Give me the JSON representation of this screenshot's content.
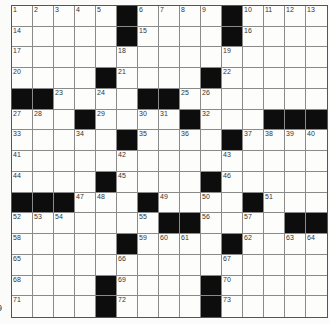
{
  "page_number": "9",
  "grid": {
    "rows": 15,
    "cols": 15,
    "layout": [
      [
        "1",
        "2",
        "3",
        "4",
        "5",
        "#",
        "6",
        "7",
        "8",
        "9",
        "#",
        "10",
        "11",
        "12",
        "13"
      ],
      [
        "14",
        ".",
        ".",
        ".",
        ".",
        "#",
        "15",
        ".",
        ".",
        ".",
        "#",
        "16",
        ".",
        ".",
        "."
      ],
      [
        "17",
        ".",
        ".",
        ".",
        ".",
        "18",
        ".",
        ".",
        ".",
        ".",
        "19",
        ".",
        ".",
        ".",
        "."
      ],
      [
        "20",
        ".",
        ".",
        ".",
        "#",
        "21",
        ".",
        ".",
        ".",
        "#",
        "22",
        ".",
        ".",
        ".",
        "."
      ],
      [
        "#",
        "#",
        "23",
        ".",
        "24",
        ".",
        "#",
        "#",
        "25",
        "26",
        ".",
        ".",
        ".",
        ".",
        "."
      ],
      [
        "27",
        "28",
        ".",
        "#",
        "29",
        ".",
        "30",
        "31",
        "#",
        "32",
        ".",
        ".",
        "#",
        "#",
        "#"
      ],
      [
        "33",
        ".",
        ".",
        "34",
        ".",
        "#",
        "35",
        ".",
        "36",
        ".",
        "#",
        "37",
        "38",
        "39",
        "40"
      ],
      [
        "41",
        ".",
        ".",
        ".",
        ".",
        "42",
        ".",
        ".",
        ".",
        ".",
        "43",
        ".",
        ".",
        ".",
        "."
      ],
      [
        "44",
        ".",
        ".",
        ".",
        "#",
        "45",
        ".",
        ".",
        ".",
        "#",
        "46",
        ".",
        ".",
        ".",
        "."
      ],
      [
        "#",
        "#",
        "#",
        "47",
        "48",
        ".",
        "#",
        "49",
        ".",
        "50",
        ".",
        "#",
        "51",
        ".",
        "."
      ],
      [
        "52",
        "53",
        "54",
        ".",
        ".",
        ".",
        "55",
        "#",
        "#",
        "56",
        ".",
        "57",
        ".",
        "#",
        "#"
      ],
      [
        "58",
        ".",
        ".",
        ".",
        ".",
        "#",
        "59",
        "60",
        "61",
        ".",
        "#",
        "62",
        ".",
        "63",
        "64"
      ],
      [
        "65",
        ".",
        ".",
        ".",
        ".",
        "66",
        ".",
        ".",
        ".",
        ".",
        "67",
        ".",
        ".",
        ".",
        "."
      ],
      [
        "68",
        ".",
        ".",
        ".",
        "#",
        "69",
        ".",
        ".",
        ".",
        "#",
        "70",
        ".",
        ".",
        ".",
        "."
      ],
      [
        "71",
        ".",
        ".",
        ".",
        "#",
        "72",
        ".",
        ".",
        ".",
        "#",
        "73",
        ".",
        ".",
        ".",
        "."
      ]
    ]
  }
}
